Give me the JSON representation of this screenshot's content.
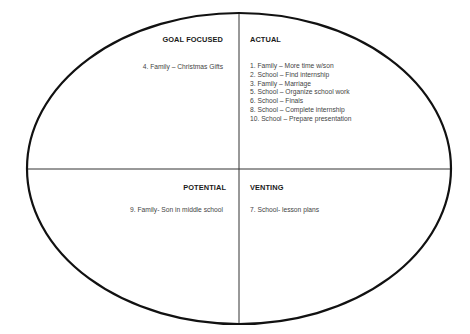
{
  "diagram": {
    "type": "quadrant-ellipse",
    "colors": {
      "outline": "#111111",
      "divider": "#333333",
      "title": "#1a1a1a",
      "item": "#444444"
    },
    "quadrants": {
      "top_left": {
        "title": "GOAL FOCUSED",
        "items": [
          "4. Family – Christmas Gifts"
        ]
      },
      "top_right": {
        "title": "ACTUAL",
        "items": [
          "1. Family – More time w/son",
          "2. School – Find internship",
          "3. Family – Marriage",
          "5. School – Organize school work",
          "6. School – Finals",
          "8. School – Complete internship",
          "10. School – Prepare presentation"
        ]
      },
      "bottom_left": {
        "title": "POTENTIAL",
        "items": [
          "9. Family- Son in middle school"
        ]
      },
      "bottom_right": {
        "title": "VENTING",
        "items": [
          "7. School- lesson plans"
        ]
      }
    }
  }
}
